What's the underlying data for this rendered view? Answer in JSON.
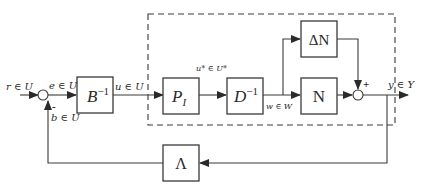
{
  "diagram": {
    "type": "block-diagram",
    "signals": {
      "r": "r ∈ U",
      "e": "e ∈ U",
      "u": "u ∈ U",
      "u_star": "u* ∈ U*",
      "w": "w ∈ W",
      "y": "y ∈ Y",
      "b": "b ∈ U"
    },
    "blocks": {
      "b_inv": {
        "base": "B",
        "sup": "−1"
      },
      "p_i": {
        "base": "P",
        "sub": "I"
      },
      "d_inv": {
        "base": "D",
        "sup": "−1"
      },
      "delta_n": "ΔN",
      "n": "N",
      "lambda": "Λ"
    },
    "signs": {
      "sum1_feedback": "-",
      "sum2_top": "+"
    }
  }
}
